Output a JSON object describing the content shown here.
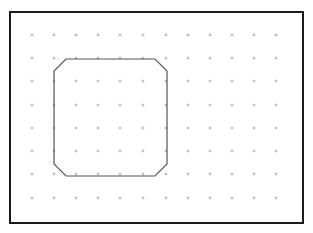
{
  "canvas": {
    "width": 313,
    "height": 233,
    "background": "#ffffff"
  },
  "frame": {
    "x": 10,
    "y": 12,
    "width": 293,
    "height": 211,
    "stroke": "#1a1a1a",
    "stroke_width": 2
  },
  "grid": {
    "color": "#9a9a9a",
    "xs": [
      32,
      54,
      76,
      98,
      120,
      143,
      166,
      188,
      210,
      232,
      254,
      276
    ],
    "ys": [
      35,
      58,
      81,
      105,
      128,
      151,
      174,
      198
    ],
    "mark": "plus"
  },
  "shape": {
    "type": "octagon",
    "points": "66,59 155,59 167,71 167,164 155,176 66,176 54,164 54,71",
    "stroke": "#555555",
    "stroke_width": 1.2
  }
}
